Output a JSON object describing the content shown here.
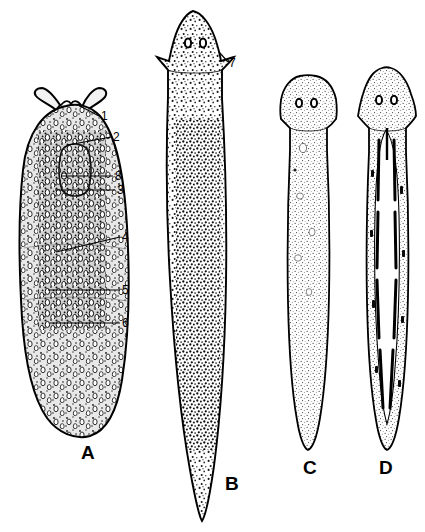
{
  "figure": {
    "kind": "scientific-illustration",
    "background_color": "#ffffff",
    "ink_color": "#000000",
    "width": 425,
    "height": 532
  },
  "specimens": [
    {
      "letter": "A",
      "label_x": 81,
      "label_y": 443,
      "head_shape": "pair-of-tentacles",
      "body_shape": "broad-oval",
      "surface": "dense-papillae",
      "eyespots": 0
    },
    {
      "letter": "B",
      "label_x": 225,
      "label_y": 474,
      "head_shape": "pointed-with-auricles",
      "body_shape": "long-slender-tapered",
      "surface": "coarse-stipple",
      "eyespots": 2
    },
    {
      "letter": "C",
      "label_x": 303,
      "label_y": 458,
      "head_shape": "truncate-blunt",
      "body_shape": "slender-tapered",
      "surface": "fine-stipple",
      "eyespots": 2
    },
    {
      "letter": "D",
      "label_x": 379,
      "label_y": 458,
      "head_shape": "triangular-arrow",
      "body_shape": "slender-tapered",
      "surface": "fine-stipple-with-dark-median-gut",
      "eyespots": 2
    }
  ],
  "callouts": [
    {
      "id": "1",
      "text": "1",
      "label_x": 101,
      "label_y": 110,
      "line_from_x": 99,
      "line_from_y": 116,
      "line_to_x": 80,
      "line_to_y": 106,
      "specimen": "A"
    },
    {
      "id": "2",
      "text": "2",
      "label_x": 113,
      "label_y": 131,
      "line_from_x": 111,
      "line_from_y": 137,
      "line_to_x": 68,
      "line_to_y": 145,
      "specimen": "A"
    },
    {
      "id": "8",
      "text": "8",
      "label_x": 115,
      "label_y": 170,
      "line_from_x": 113,
      "line_from_y": 176,
      "line_to_x": 62,
      "line_to_y": 176,
      "specimen": "A"
    },
    {
      "id": "3",
      "text": "3",
      "label_x": 117,
      "label_y": 184,
      "line_from_x": 115,
      "line_from_y": 190,
      "line_to_x": 55,
      "line_to_y": 190,
      "specimen": "A"
    },
    {
      "id": "4",
      "text": "4",
      "label_x": 122,
      "label_y": 231,
      "line_from_x": 120,
      "line_from_y": 237,
      "line_to_x": 56,
      "line_to_y": 252,
      "specimen": "A"
    },
    {
      "id": "5",
      "text": "5",
      "label_x": 122,
      "label_y": 284,
      "line_from_x": 120,
      "line_from_y": 290,
      "line_to_x": 48,
      "line_to_y": 290,
      "specimen": "A"
    },
    {
      "id": "6",
      "text": "6",
      "label_x": 122,
      "label_y": 317,
      "line_from_x": 120,
      "line_from_y": 323,
      "line_to_x": 50,
      "line_to_y": 323,
      "specimen": "A"
    },
    {
      "id": "7",
      "text": "7",
      "label_x": 229,
      "label_y": 57,
      "line_from_x": 228,
      "line_from_y": 62,
      "line_to_x": 219,
      "line_to_y": 52,
      "specimen": "B"
    }
  ]
}
